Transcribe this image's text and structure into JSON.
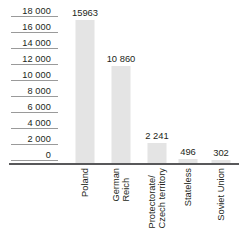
{
  "chart_data": {
    "type": "bar",
    "title": "",
    "subtitle": "",
    "xlabel": "",
    "ylabel": "",
    "categories": [
      "Poland",
      "German\nReich",
      "Protectorate/\nCzech territory",
      "Stateless",
      "Soviet Union"
    ],
    "values": [
      15963,
      10860,
      2241,
      496,
      302
    ],
    "value_labels": [
      "15963",
      "10 860",
      "2 241",
      "496",
      "302"
    ],
    "ylim": [
      0,
      18000
    ],
    "ytick_values": [
      18000,
      16000,
      14000,
      12000,
      10000,
      8000,
      6000,
      4000,
      2000,
      0
    ],
    "ytick_labels": [
      "18 000",
      "16 000",
      "14 000",
      "12 000",
      "10 000",
      "8 000",
      "6 000",
      "4 000",
      "2 000",
      "0"
    ],
    "grid": true,
    "legend": false,
    "bar_color": "#e4e4e4",
    "axis_color": "#58585a",
    "grid_color": "#9a9a9a",
    "text_color": "#231f20"
  }
}
